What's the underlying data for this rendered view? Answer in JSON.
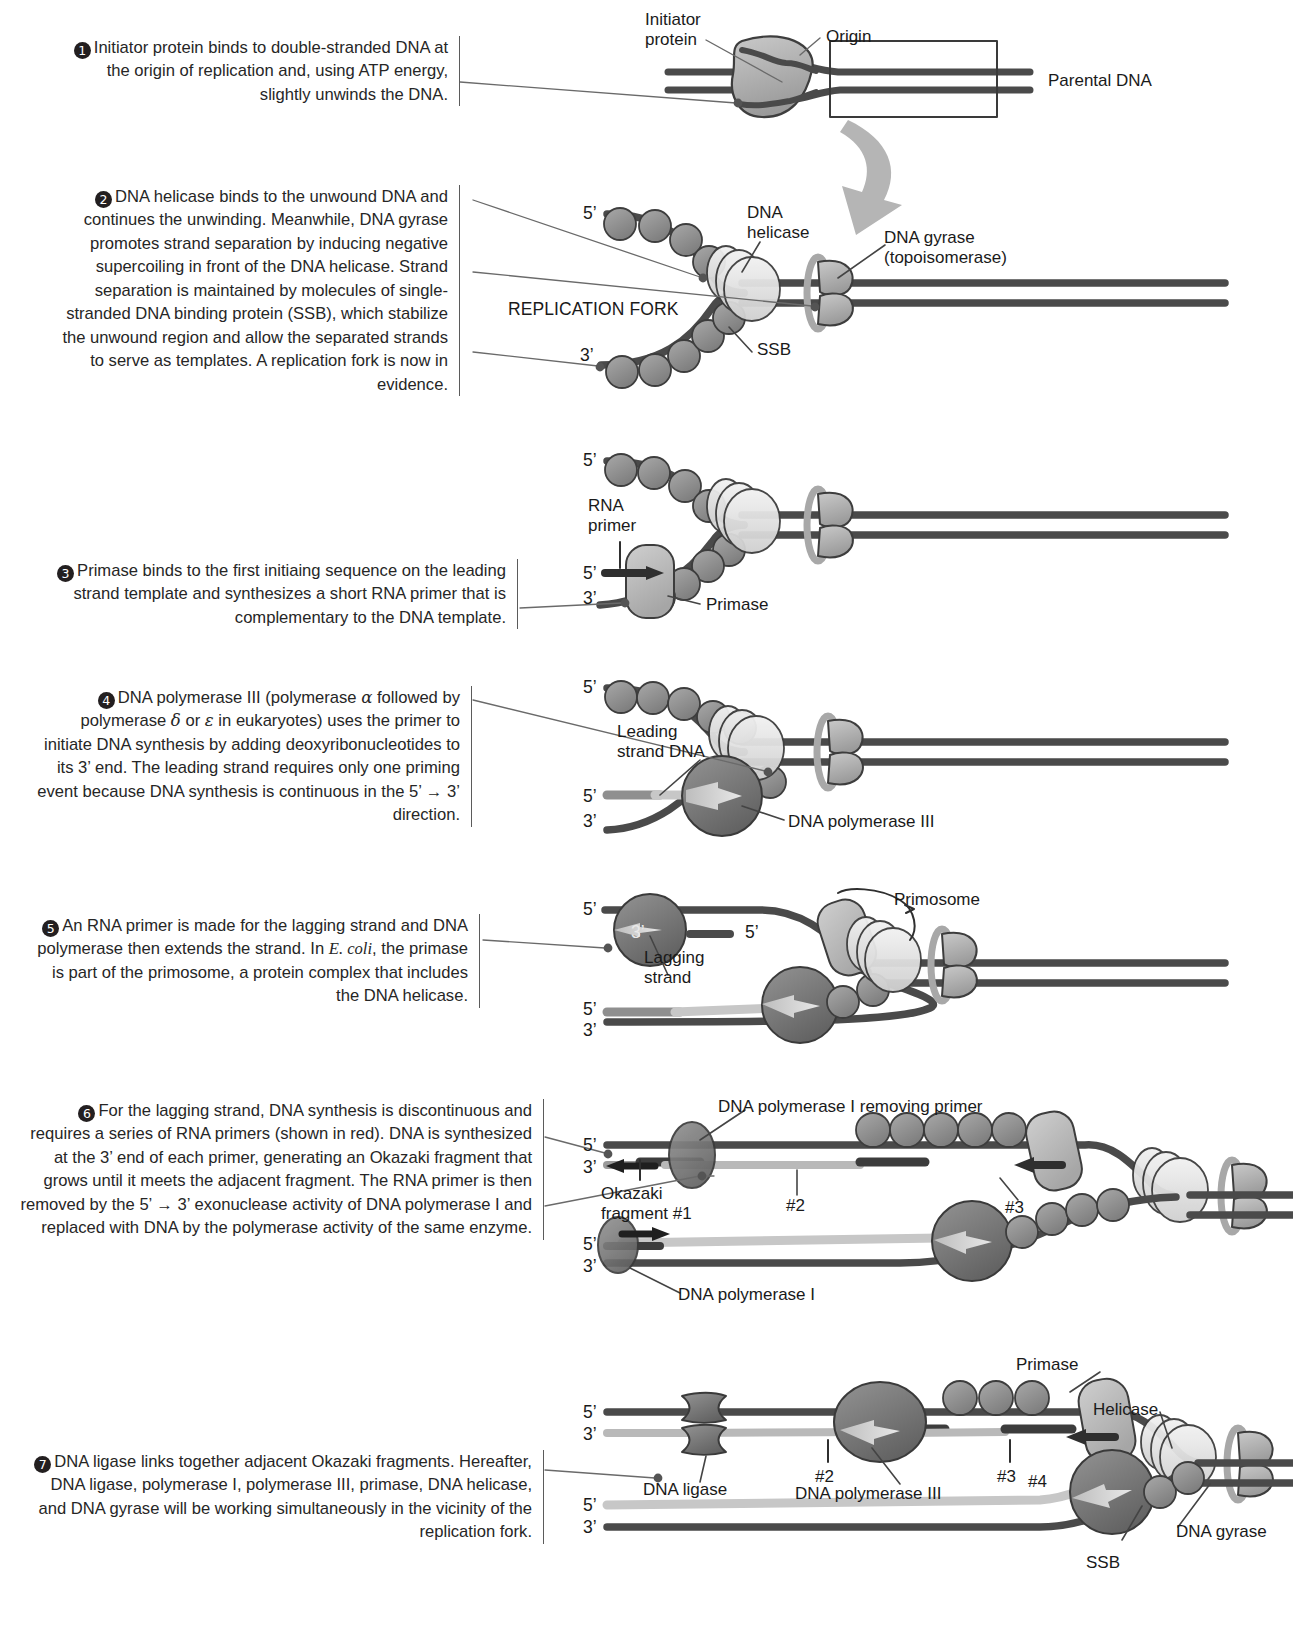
{
  "figure": {
    "type": "process-diagram",
    "step_count": 7
  },
  "steps": [
    {
      "number": "1",
      "text": "Initiator protein binds to double-stranded DNA at the origin of replication and, using ATP energy, slightly unwinds the DNA."
    },
    {
      "number": "2",
      "text": "DNA helicase binds to the unwound DNA and continues the unwinding. Meanwhile, DNA gyrase promotes strand separation by inducing negative supercoiling in front of the DNA helicase. Strand separation is maintained by molecules of single-stranded DNA binding protein (SSB), which stabilize the unwound region and allow the separated strands to serve as templates. A replication fork is now in evidence."
    },
    {
      "number": "3",
      "text": "Primase binds to the first initiaing sequence on the leading strand template and synthesizes a short RNA primer that is complementary to the DNA template."
    },
    {
      "number": "4",
      "text_parts": [
        "DNA polymerase III (polymerase ",
        "α",
        " followed by polymerase ",
        "δ",
        " or ",
        "ε",
        " in eukaryotes) uses the primer to initiate DNA synthesis by adding deoxyribonucleotides to its 3’ end. The leading strand requires only one priming event because DNA synthesis is continuous in the 5’ → 3’ direction."
      ]
    },
    {
      "number": "5",
      "text_parts": [
        "An RNA primer is made for the lagging strand and DNA polymerase then extends the strand. In ",
        "E. coli",
        ", the primase is part of the primosome, a protein complex that includes the DNA helicase."
      ]
    },
    {
      "number": "6",
      "text": "For the lagging strand, DNA synthesis is discontinuous and requires a series of RNA primers (shown in red). DNA is synthesized at the 3’ end of each primer, generating an Okazaki fragment that grows until it meets the adjacent fragment. The RNA primer is then removed by the 5’ → 3’ exonuclease activity of DNA polymerase I and replaced with DNA by the polymerase activity of the same enzyme."
    },
    {
      "number": "7",
      "text": "DNA ligase links together adjacent Okazaki fragments. Hereafter, DNA ligase, polymerase I, polymerase III, primase, DNA helicase, and DNA gyrase will be working simultaneously in the vicinity of the replication fork."
    }
  ],
  "panel1": {
    "initiator_protein": "Initiator\nprotein",
    "origin": "Origin",
    "parental_dna": "Parental DNA"
  },
  "panel2": {
    "five_prime": "5’",
    "three_prime": "3’",
    "dna_helicase": "DNA\nhelicase",
    "dna_gyrase": "DNA gyrase\n(topoisomerase)",
    "replication_fork": "REPLICATION FORK",
    "ssb": "SSB"
  },
  "panel3": {
    "five_prime": "5’",
    "three_prime": "3’",
    "rna_primer": "RNA\nprimer",
    "primase": "Primase"
  },
  "panel4": {
    "five_prime": "5’",
    "three_prime": "3’",
    "leading_strand_dna": "Leading\nstrand DNA",
    "dna_polymerase_iii": "DNA polymerase III"
  },
  "panel5": {
    "five_prime": "5’",
    "three_prime": "3’",
    "primosome": "Primosome",
    "lagging_strand": "Lagging\nstrand"
  },
  "panel6": {
    "five_prime": "5’",
    "three_prime": "3’",
    "pol_i_removing_primer": "DNA polymerase I removing primer",
    "okazaki_fragment_1": "Okazaki\nfragment #1",
    "fragment_2": "#2",
    "fragment_3": "#3",
    "dna_polymerase_i": "DNA polymerase I"
  },
  "panel7": {
    "five_prime": "5’",
    "three_prime": "3’",
    "primase": "Primase",
    "helicase": "Helicase",
    "dna_ligase": "DNA ligase",
    "fragment_2": "#2",
    "fragment_3": "#3",
    "fragment_4": "#4",
    "dna_polymerase_iii": "DNA polymerase III",
    "dna_gyrase": "DNA gyrase",
    "ssb": "SSB"
  },
  "colors": {
    "dna_template_dark": "#4a4a4a",
    "new_dna_light": "#b9b9b9",
    "rna_primer": "#3a3a3a",
    "ssb_fill": "#8c8c8c",
    "helicase_fill": "#dcdcdc",
    "polymerase_fill": "#777777",
    "primase_fill": "#b0b0b0",
    "gyrase_fill": "#8f8f8f",
    "text": "#262626"
  }
}
